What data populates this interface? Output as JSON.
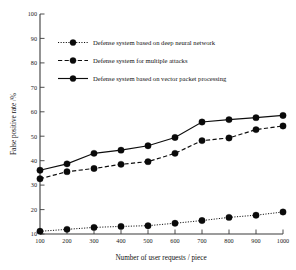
{
  "chart_data": {
    "type": "line",
    "title": "",
    "xlabel": "Number of user requests / piece",
    "ylabel": "False positive rate /%",
    "x": [
      100,
      200,
      300,
      400,
      500,
      600,
      700,
      800,
      900,
      1000
    ],
    "xlim": [
      100,
      1000
    ],
    "ylim": [
      10,
      100
    ],
    "xticks": [
      "100",
      "200",
      "300",
      "400",
      "500",
      "600",
      "700",
      "800",
      "900",
      "1000"
    ],
    "yticks": [
      "10",
      "20",
      "30",
      "40",
      "50",
      "60",
      "70",
      "80",
      "90",
      "100"
    ],
    "grid": false,
    "legend_position": "upper-left-inside",
    "series": [
      {
        "name": "Defense system based on deep neural network",
        "style": "dotted",
        "marker": "circle",
        "color": "#0d0d0d",
        "values": [
          11.1,
          11.9,
          12.7,
          13.1,
          13.4,
          14.4,
          15.5,
          16.8,
          17.7,
          19.0
        ]
      },
      {
        "name": "Defense system for multiple attacks",
        "style": "dashed",
        "marker": "circle",
        "color": "#0d0d0d",
        "values": [
          32.6,
          35.5,
          36.8,
          38.5,
          39.6,
          43.0,
          48.2,
          49.3,
          52.7,
          54.2
        ]
      },
      {
        "name": "Defense system based on vector packet processing",
        "style": "solid",
        "marker": "circle",
        "color": "#0d0d0d",
        "values": [
          36.1,
          38.7,
          43.0,
          44.3,
          46.1,
          49.5,
          55.8,
          56.8,
          57.6,
          58.5
        ]
      }
    ]
  },
  "axes": {
    "x_title": "Number of user requests / piece",
    "y_title": "False positive rate /%"
  },
  "legend": {
    "items": [
      {
        "label": "Defense system based on deep neural network",
        "style": "dotted"
      },
      {
        "label": "Defense system for multiple attacks",
        "style": "dashed"
      },
      {
        "label": "Defense system based on vector packet processing",
        "style": "solid"
      }
    ]
  },
  "colors": {
    "ink": "#0d0d0d",
    "axis": "#3b3b3b",
    "background": "#ffffff"
  }
}
